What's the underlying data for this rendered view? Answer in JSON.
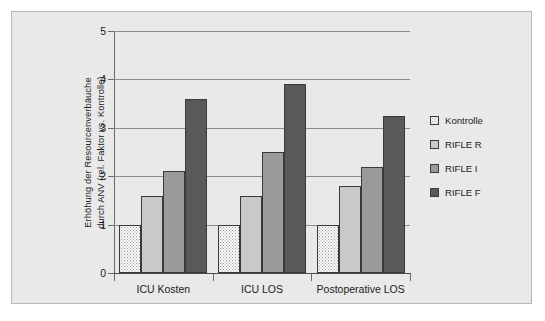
{
  "chart_data": {
    "type": "bar",
    "title": "",
    "subtitle": "",
    "xlabel": "",
    "ylabel": "Erhöhung der Resourcenverbäuche durch ANV (rel. Faktor vs. Kontrolle)",
    "ylabel_line1": "Erhöhung der Resourcenverbäuche",
    "ylabel_line2": "durch ANV (rel. Faktor vs. Kontrolle)",
    "categories": [
      "ICU Kosten",
      "ICU LOS",
      "Postoperative LOS"
    ],
    "series": [
      {
        "name": "Kontrolle",
        "values": [
          1.0,
          1.0,
          1.0
        ],
        "color": "#fbfbfb",
        "pattern": "dotted"
      },
      {
        "name": "RIFLE R",
        "values": [
          1.6,
          1.6,
          1.8
        ],
        "color": "#c9c9c9",
        "pattern": "solid"
      },
      {
        "name": "RIFLE I",
        "values": [
          2.1,
          2.5,
          2.2
        ],
        "color": "#9a9a9a",
        "pattern": "solid"
      },
      {
        "name": "RIFLE F",
        "values": [
          3.6,
          3.9,
          3.25
        ],
        "color": "#595959",
        "pattern": "solid"
      }
    ],
    "ylim": [
      0,
      5
    ],
    "yticks": [
      "0",
      "1",
      "2",
      "3",
      "4",
      "5"
    ],
    "ytick_values": [
      0,
      1,
      2,
      3,
      4,
      5
    ],
    "grid": true,
    "grid_axis": "y",
    "legend_position": "right",
    "legend_entries": [
      "Kontrolle",
      "RIFLE R",
      "RIFLE I",
      "RIFLE F"
    ]
  },
  "panel": {
    "background_color": "#e9e9e9",
    "border_color": "#b9b9b9"
  }
}
